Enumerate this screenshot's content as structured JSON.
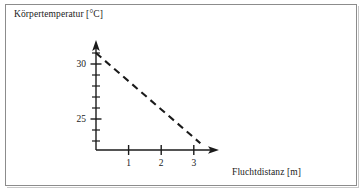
{
  "figure": {
    "y_axis_title": "Körpertemperatur [°C]",
    "x_axis_title": "Fluchtdistanz [m]"
  },
  "chart_data": {
    "type": "line",
    "title": "",
    "xlabel": "Fluchtdistanz [m]",
    "ylabel": "Körpertemperatur [°C]",
    "xlim": [
      0,
      3.7
    ],
    "ylim": [
      22.5,
      31.8
    ],
    "grid": false,
    "legend": null,
    "x_ticks": [
      1,
      2,
      3
    ],
    "x_tick_labels": [
      "1",
      "2",
      "3"
    ],
    "y_ticks": [
      23,
      24,
      25,
      26,
      27,
      28,
      29,
      30,
      31
    ],
    "y_tick_labels": [
      "",
      "",
      "25",
      "",
      "",
      "",
      "",
      "30",
      ""
    ],
    "y_major_ticks": [
      25,
      30
    ],
    "series": [
      {
        "name": "Körpertemperatur",
        "style": "dashed",
        "color": "#1a1a1a",
        "x": [
          0,
          3.2
        ],
        "y": [
          31.0,
          22.8
        ]
      }
    ],
    "annotations": []
  },
  "axis_geometry": {
    "origin_x_px": 96,
    "origin_y_px": 150,
    "x_arrow_end_px": 219,
    "y_arrow_top_px": 41
  }
}
